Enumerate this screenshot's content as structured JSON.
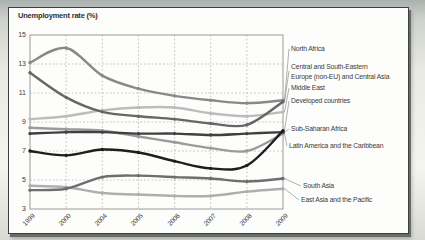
{
  "figure": {
    "title": "Unemployment rate (%)"
  },
  "chart_data": {
    "type": "line",
    "title": "Unemployment rate (%)",
    "x_labels": [
      "1999",
      "2000",
      "2004",
      "2005",
      "2006",
      "2007",
      "2008",
      "2009"
    ],
    "yticks": [
      15,
      13,
      11,
      9,
      7,
      5,
      3
    ],
    "ylim": [
      3,
      15
    ],
    "grid": "dashed-both-axes",
    "legend_position": "right-outside-with-leader-lines",
    "axis_color": "#9a9a9a",
    "grid_color": "#b3b3b3",
    "leader_color": "#8f8f8f",
    "text_color": "#3a3a3a",
    "plot_area": {
      "x0": 30,
      "y0": 35,
      "x1": 283,
      "y1": 209
    },
    "draw_order": [
      2,
      7,
      5,
      0,
      6,
      1,
      4,
      3
    ],
    "series": [
      {
        "name": "North Africa",
        "color": "#898989",
        "values": [
          13.1,
          14.1,
          12.2,
          11.3,
          10.8,
          10.5,
          10.3,
          10.5
        ],
        "label_lines": [
          "North Africa"
        ],
        "label_x": 291,
        "label_y": 49
      },
      {
        "name": "Central and South-Eastern Europe (non-EU) and Central Asia",
        "color": "#666666",
        "values": [
          12.4,
          10.7,
          9.7,
          9.4,
          9.2,
          8.9,
          8.8,
          10.4
        ],
        "label_lines": [
          "Central and South-Eastern",
          "Europe (non-EU) and Central Asia"
        ],
        "label_x": 291,
        "label_y": 71
      },
      {
        "name": "Middle East",
        "color": "#bcbcbc",
        "values": [
          9.2,
          9.4,
          9.8,
          10.0,
          10.0,
          9.6,
          9.4,
          9.7
        ],
        "label_lines": [
          "Middle East"
        ],
        "label_x": 291,
        "label_y": 88
      },
      {
        "name": "Developed countries",
        "color": "#1e1e1e",
        "values": [
          7.0,
          6.7,
          7.1,
          6.9,
          6.3,
          5.8,
          6.0,
          8.4
        ],
        "label_lines": [
          "Developed countries"
        ],
        "label_x": 291,
        "label_y": 101
      },
      {
        "name": "Sub-Saharan Africa",
        "color": "#404040",
        "values": [
          8.2,
          8.3,
          8.3,
          8.2,
          8.2,
          8.1,
          8.2,
          8.3
        ],
        "label_lines": [
          "Sub-Saharan Africa"
        ],
        "label_x": 291,
        "label_y": 129
      },
      {
        "name": "Latin America and the Caribbean",
        "color": "#9b9b9b",
        "values": [
          8.6,
          8.5,
          8.4,
          8.0,
          7.6,
          7.2,
          7.0,
          8.2
        ],
        "label_lines": [
          "Latin America and the Caribbean"
        ],
        "label_x": 289,
        "label_y": 146
      },
      {
        "name": "South Asia",
        "color": "#6e6e6e",
        "values": [
          4.3,
          4.4,
          5.2,
          5.3,
          5.2,
          5.1,
          4.9,
          5.1
        ],
        "label_lines": [
          "South Asia"
        ],
        "label_x": 303,
        "label_y": 186
      },
      {
        "name": "East Asia and the Pacific",
        "color": "#aeaeae",
        "values": [
          4.6,
          4.5,
          4.1,
          4.0,
          3.9,
          3.9,
          4.2,
          4.4
        ],
        "label_lines": [
          "East Asia and the Pacific"
        ],
        "label_x": 301,
        "label_y": 200
      }
    ]
  }
}
